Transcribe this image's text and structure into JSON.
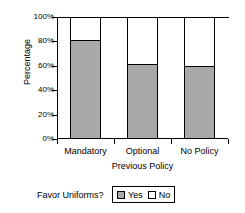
{
  "chart_data": {
    "type": "bar",
    "subtype": "stacked-100-percent",
    "title": "",
    "xlabel": "Previous Policy",
    "ylabel": "Percentage",
    "categories": [
      "Mandatory",
      "Optional",
      "No Policy"
    ],
    "series": [
      {
        "name": "Yes",
        "color": "#a9a9a9",
        "values": [
          80,
          61,
          59
        ]
      },
      {
        "name": "No",
        "color": "#ffffff",
        "values": [
          20,
          39,
          41
        ]
      }
    ],
    "ylim": [
      0,
      100
    ],
    "yticks": [
      0,
      20,
      40,
      60,
      80,
      100
    ],
    "ytick_labels": [
      "0%",
      "20%",
      "40%",
      "60%",
      "80%",
      "100%"
    ],
    "grid": false,
    "legend_position": "bottom",
    "legend_title": "Favor Uniforms?"
  },
  "axes": {
    "y_title": "Percentage",
    "x_title": "Previous Policy",
    "y_tick_labels": [
      "100%",
      "80%",
      "60%",
      "40%",
      "20%",
      "0%"
    ],
    "x_tick_labels": [
      "Mandatory",
      "Optional",
      "No Policy"
    ]
  },
  "legend": {
    "prompt": "Favor Uniforms?",
    "entries": [
      {
        "label": "Yes",
        "swatch": "gray-swatch-icon"
      },
      {
        "label": "No",
        "swatch": "white-swatch-icon"
      }
    ]
  }
}
